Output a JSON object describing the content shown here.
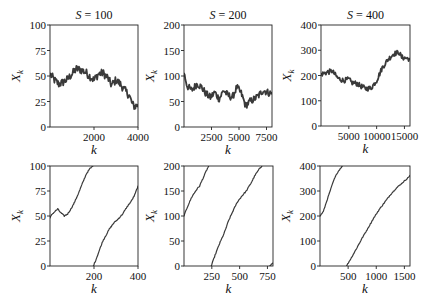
{
  "figure": {
    "line_color": "#3a3a3a",
    "rows": 2,
    "cols": 3
  },
  "chart_data": [
    {
      "type": "line",
      "panel": "top-left",
      "title": "S = 100",
      "title_var": "S",
      "title_val": "100",
      "xlabel": "k",
      "ylabel": "X_k",
      "xlim": [
        0,
        4000
      ],
      "ylim": [
        0,
        100
      ],
      "xticks": [
        2000,
        4000
      ],
      "xtick_labels": [
        "2000",
        "4000"
      ],
      "yticks": [
        0,
        25,
        50,
        75,
        100
      ],
      "ytick_labels": [
        "0",
        "25",
        "50",
        "75",
        "100"
      ],
      "noise": 4,
      "stroke_width": 1.8,
      "segments": [
        [
          [
            0,
            52
          ],
          [
            200,
            46
          ],
          [
            400,
            42
          ],
          [
            600,
            44
          ],
          [
            800,
            47
          ],
          [
            1000,
            52
          ],
          [
            1200,
            57
          ],
          [
            1400,
            56
          ],
          [
            1600,
            54
          ],
          [
            1800,
            50
          ],
          [
            2000,
            46
          ],
          [
            2200,
            52
          ],
          [
            2400,
            53
          ],
          [
            2600,
            49
          ],
          [
            2800,
            41
          ],
          [
            3000,
            46
          ],
          [
            3200,
            42
          ],
          [
            3400,
            36
          ],
          [
            3600,
            31
          ],
          [
            3750,
            22
          ],
          [
            3850,
            20
          ],
          [
            4000,
            22
          ]
        ]
      ]
    },
    {
      "type": "line",
      "panel": "top-middle",
      "title": "S = 200",
      "title_var": "S",
      "title_val": "200",
      "xlabel": "k",
      "ylabel": "X_k",
      "xlim": [
        0,
        8000
      ],
      "ylim": [
        0,
        200
      ],
      "xticks": [
        2500,
        5000,
        7500
      ],
      "xtick_labels": [
        "2500",
        "5000",
        "7500"
      ],
      "yticks": [
        0,
        50,
        100,
        150,
        200
      ],
      "yticks_labels_note": "",
      "ytick_labels": [
        "0",
        "50",
        "100",
        "150",
        "200"
      ],
      "noise": 7,
      "stroke_width": 1.8,
      "segments": [
        [
          [
            0,
            105
          ],
          [
            300,
            80
          ],
          [
            700,
            72
          ],
          [
            1200,
            85
          ],
          [
            1600,
            78
          ],
          [
            2000,
            65
          ],
          [
            2400,
            58
          ],
          [
            2800,
            68
          ],
          [
            3200,
            55
          ],
          [
            3600,
            72
          ],
          [
            4000,
            62
          ],
          [
            4400,
            58
          ],
          [
            4800,
            78
          ],
          [
            5200,
            66
          ],
          [
            5600,
            42
          ],
          [
            6000,
            50
          ],
          [
            6400,
            55
          ],
          [
            6800,
            62
          ],
          [
            7200,
            72
          ],
          [
            7600,
            68
          ],
          [
            8000,
            65
          ]
        ]
      ]
    },
    {
      "type": "line",
      "panel": "top-right",
      "title": "S = 400",
      "title_var": "S",
      "title_val": "400",
      "xlabel": "k",
      "ylabel": "X_k",
      "xlim": [
        0,
        16000
      ],
      "ylim": [
        0,
        400
      ],
      "xticks": [
        5000,
        10000,
        15000
      ],
      "xtick_labels": [
        "5000",
        "10000",
        "15000"
      ],
      "yticks": [
        0,
        100,
        200,
        300,
        400
      ],
      "ytick_labels": [
        "0",
        "100",
        "200",
        "300",
        "400"
      ],
      "noise": 10,
      "stroke_width": 1.8,
      "segments": [
        [
          [
            0,
            205
          ],
          [
            1000,
            212
          ],
          [
            2000,
            218
          ],
          [
            3000,
            190
          ],
          [
            4000,
            180
          ],
          [
            5000,
            185
          ],
          [
            5500,
            172
          ],
          [
            6500,
            168
          ],
          [
            7000,
            160
          ],
          [
            8000,
            148
          ],
          [
            9000,
            150
          ],
          [
            10000,
            180
          ],
          [
            11000,
            230
          ],
          [
            12000,
            262
          ],
          [
            13000,
            285
          ],
          [
            14000,
            292
          ],
          [
            14500,
            272
          ],
          [
            15500,
            268
          ],
          [
            16000,
            265
          ]
        ]
      ]
    },
    {
      "type": "line",
      "panel": "bottom-left",
      "title": "",
      "xlabel": "k",
      "ylabel": "X_k",
      "xlim": [
        0,
        400
      ],
      "ylim": [
        0,
        100
      ],
      "xticks": [
        200,
        400
      ],
      "xtick_labels": [
        "200",
        "400"
      ],
      "yticks": [
        0,
        25,
        50,
        75,
        100
      ],
      "ytick_labels": [
        "0",
        "25",
        "50",
        "75",
        "100"
      ],
      "noise": 0.6,
      "stroke_width": 1.2,
      "segments": [
        [
          [
            0,
            48
          ],
          [
            10,
            52
          ],
          [
            20,
            54
          ],
          [
            35,
            57
          ],
          [
            50,
            53
          ],
          [
            65,
            50
          ],
          [
            80,
            52
          ],
          [
            95,
            57
          ],
          [
            110,
            63
          ],
          [
            130,
            73
          ],
          [
            150,
            84
          ],
          [
            165,
            92
          ],
          [
            180,
            97
          ],
          [
            195,
            100
          ]
        ],
        [
          [
            197,
            0
          ],
          [
            210,
            7
          ],
          [
            225,
            16
          ],
          [
            240,
            25
          ],
          [
            255,
            31
          ],
          [
            270,
            37
          ],
          [
            290,
            43
          ],
          [
            310,
            47
          ],
          [
            330,
            52
          ],
          [
            350,
            59
          ],
          [
            370,
            65
          ],
          [
            385,
            71
          ],
          [
            400,
            80
          ]
        ]
      ]
    },
    {
      "type": "line",
      "panel": "bottom-middle",
      "title": "",
      "xlabel": "k",
      "ylabel": "X_k",
      "xlim": [
        0,
        800
      ],
      "ylim": [
        0,
        200
      ],
      "xticks": [
        250,
        500,
        750
      ],
      "xtick_labels": [
        "250",
        "500",
        "750"
      ],
      "yticks": [
        0,
        50,
        100,
        150,
        200
      ],
      "ytick_labels": [
        "0",
        "50",
        "100",
        "150",
        "200"
      ],
      "noise": 1.2,
      "stroke_width": 1.2,
      "segments": [
        [
          [
            0,
            100
          ],
          [
            30,
            118
          ],
          [
            70,
            138
          ],
          [
            110,
            152
          ],
          [
            140,
            160
          ],
          [
            170,
            175
          ],
          [
            200,
            190
          ],
          [
            222,
            200
          ]
        ],
        [
          [
            245,
            0
          ],
          [
            280,
            22
          ],
          [
            320,
            45
          ],
          [
            360,
            65
          ],
          [
            400,
            90
          ],
          [
            440,
            110
          ],
          [
            480,
            128
          ],
          [
            520,
            140
          ],
          [
            560,
            150
          ],
          [
            600,
            165
          ],
          [
            640,
            182
          ],
          [
            680,
            195
          ],
          [
            700,
            200
          ]
        ],
        [
          [
            768,
            0
          ],
          [
            800,
            6
          ]
        ]
      ]
    },
    {
      "type": "line",
      "panel": "bottom-right",
      "title": "",
      "xlabel": "k",
      "ylabel": "X_k",
      "xlim": [
        0,
        1600
      ],
      "ylim": [
        0,
        400
      ],
      "xticks": [
        500,
        1000,
        1500
      ],
      "xtick_labels": [
        "500",
        "1000",
        "1500"
      ],
      "yticks": [
        0,
        100,
        200,
        300,
        400
      ],
      "ytick_labels": [
        "0",
        "100",
        "200",
        "300",
        "400"
      ],
      "noise": 2,
      "stroke_width": 1.2,
      "segments": [
        [
          [
            0,
            200
          ],
          [
            60,
            218
          ],
          [
            120,
            260
          ],
          [
            180,
            300
          ],
          [
            240,
            340
          ],
          [
            300,
            370
          ],
          [
            360,
            390
          ],
          [
            400,
            400
          ]
        ],
        [
          [
            470,
            0
          ],
          [
            550,
            30
          ],
          [
            650,
            70
          ],
          [
            750,
            112
          ],
          [
            850,
            150
          ],
          [
            950,
            190
          ],
          [
            1050,
            225
          ],
          [
            1150,
            255
          ],
          [
            1250,
            285
          ],
          [
            1350,
            310
          ],
          [
            1450,
            330
          ],
          [
            1550,
            350
          ],
          [
            1600,
            362
          ]
        ]
      ]
    }
  ]
}
